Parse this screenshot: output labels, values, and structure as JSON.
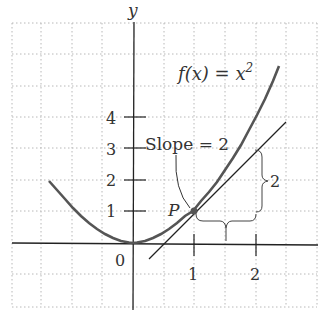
{
  "figure": {
    "axis_labels": {
      "y": "y"
    },
    "function_label": "f(x) = x",
    "function_exponent": "2",
    "slope_label": "Slope = 2",
    "point_label": "P",
    "origin_label": "0",
    "x_ticks": [
      "1",
      "2"
    ],
    "y_ticks": [
      "1",
      "2",
      "3",
      "4"
    ],
    "rise_label": "2",
    "run_label": "1",
    "colors": {
      "curve": "#555555",
      "tangent": "#222222",
      "axis": "#222222",
      "grid": "#bbbbbb"
    }
  }
}
